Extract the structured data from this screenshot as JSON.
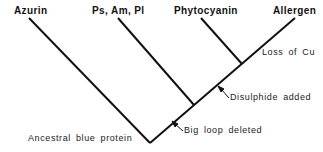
{
  "diagram": {
    "type": "phylogenetic-tree",
    "leaves": [
      {
        "label": "Azurin",
        "x": 14,
        "y": 6
      },
      {
        "label": "Ps, Am, Pl",
        "x": 92,
        "y": 6
      },
      {
        "label": "Phytocyanin",
        "x": 174,
        "y": 6
      },
      {
        "label": "Allergen",
        "x": 273,
        "y": 6
      }
    ],
    "root_label": "Ancestral blue protein",
    "events": [
      {
        "label": "Big loop deleted"
      },
      {
        "label": "Disulphide added"
      },
      {
        "label": "Loss of Cu"
      }
    ],
    "colors": {
      "line": "#111111",
      "text": "#111111"
    }
  }
}
